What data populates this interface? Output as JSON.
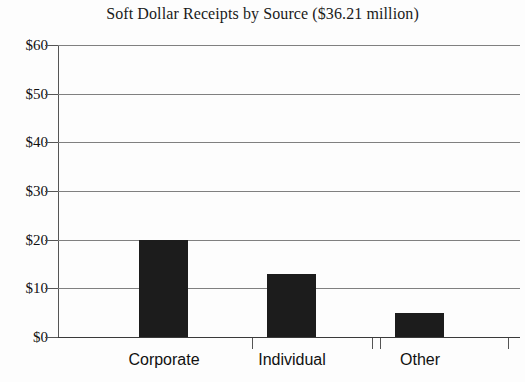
{
  "chart_data": {
    "type": "bar",
    "title": "Soft Dollar Receipts by Source ($36.21 million)",
    "subtitle": "",
    "xlabel": "",
    "ylabel": "",
    "categories": [
      "Corporate",
      "Individual",
      "Other"
    ],
    "values": [
      20,
      13,
      5
    ],
    "ylim": [
      0,
      60
    ],
    "ytick_values": [
      0,
      10,
      20,
      30,
      40,
      50,
      60
    ],
    "ytick_labels": [
      "$0",
      "$10",
      "$20",
      "$30",
      "$40",
      "$50",
      "$60"
    ],
    "grid": true,
    "legend": false,
    "legend_position": "none",
    "bar_color": "#1c1c1c",
    "gridline_color": "#808080",
    "axis_color": "#555555",
    "background_color": "#fdfdfd"
  }
}
